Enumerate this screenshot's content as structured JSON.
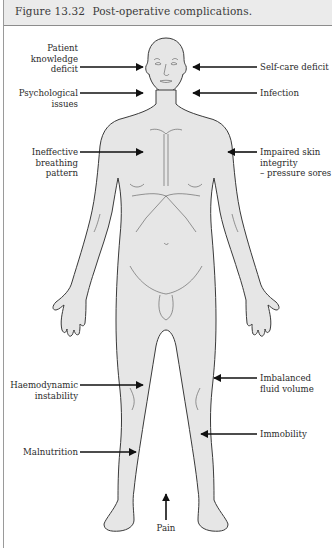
{
  "figure": {
    "number": "Figure 13.32",
    "title": "Post-operative complications."
  },
  "colors": {
    "caption_bg": "#ebebeb",
    "body_fill": "#e6e6e6",
    "outline": "#3a3a3a",
    "arrow": "#111111",
    "text": "#2b2b2b"
  },
  "labels": {
    "left": [
      {
        "id": "patient-knowledge-deficit",
        "lines": [
          "Patient",
          "knowledge",
          "deficit"
        ]
      },
      {
        "id": "psychological-issues",
        "lines": [
          "Psychological",
          "issues"
        ]
      },
      {
        "id": "ineffective-breathing-pattern",
        "lines": [
          "Ineffective",
          "breathing",
          "pattern"
        ]
      },
      {
        "id": "haemodynamic-instability",
        "lines": [
          "Haemodynamic",
          "instability"
        ]
      },
      {
        "id": "malnutrition",
        "lines": [
          "Malnutrition"
        ]
      }
    ],
    "right": [
      {
        "id": "self-care-deficit",
        "lines": [
          "Self-care deficit"
        ]
      },
      {
        "id": "infection",
        "lines": [
          "Infection"
        ]
      },
      {
        "id": "impaired-skin-integrity",
        "lines": [
          "Impaired skin",
          "integrity",
          "– pressure sores"
        ]
      },
      {
        "id": "imbalanced-fluid-volume",
        "lines": [
          "Imbalanced",
          "fluid volume"
        ]
      },
      {
        "id": "immobility",
        "lines": [
          "Immobility"
        ]
      }
    ],
    "bottom": [
      {
        "id": "pain",
        "lines": [
          "Pain"
        ]
      }
    ]
  },
  "icons": {
    "figure": "human-body-front-outline-icon",
    "pointer": "arrow-icon"
  }
}
